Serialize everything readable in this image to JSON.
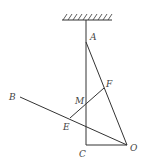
{
  "diagram": {
    "points": {
      "A": {
        "label": "A",
        "x": 86,
        "y": 42
      },
      "B": {
        "label": "B",
        "x": 20,
        "y": 97
      },
      "C": {
        "label": "C",
        "x": 86,
        "y": 145
      },
      "E": {
        "label": "E",
        "x": 70,
        "y": 118
      },
      "F": {
        "label": "F",
        "x": 104,
        "y": 88
      },
      "M": {
        "label": "M",
        "x": 86,
        "y": 104
      },
      "O": {
        "label": "O",
        "x": 127,
        "y": 145
      }
    },
    "segments": [
      "ceiling-to-C",
      "A-O",
      "B-O",
      "E-F",
      "C-O"
    ],
    "colors": {
      "line": "#333333",
      "label": "#444444",
      "background": "#ffffff"
    }
  }
}
